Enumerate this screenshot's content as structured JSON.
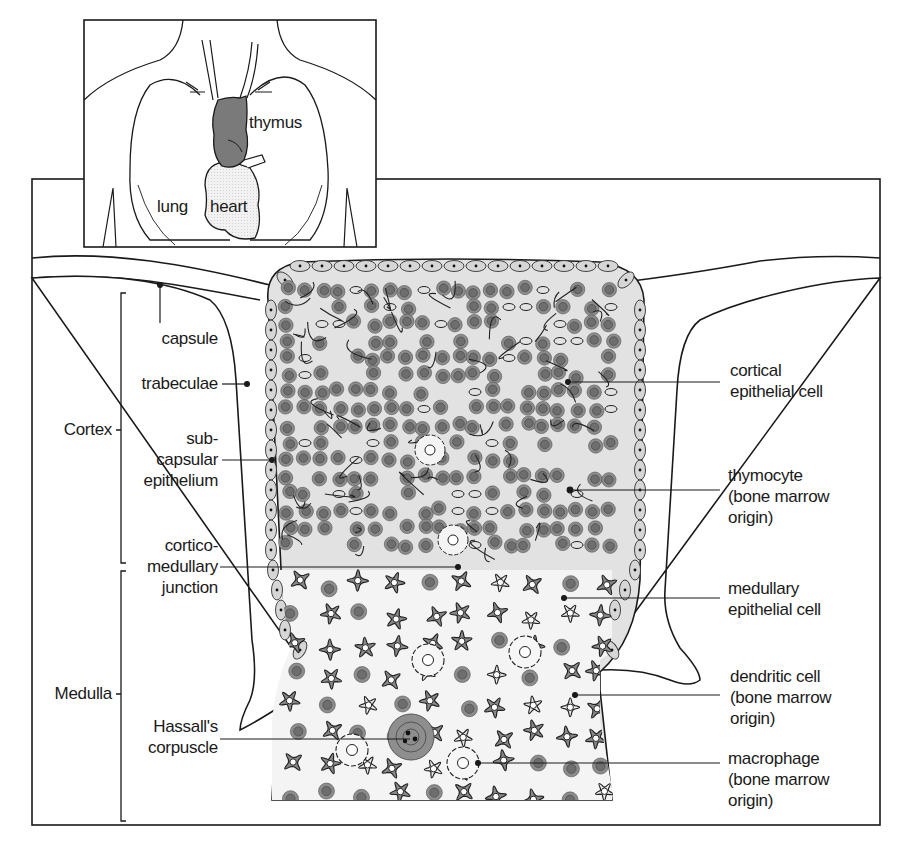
{
  "inset": {
    "labels": {
      "thymus": "thymus",
      "lung": "lung",
      "heart": "heart"
    }
  },
  "labels": {
    "left": {
      "cortex": "Cortex",
      "medulla": "Medulla",
      "capsule": "capsule",
      "trabeculae": "trabeculae",
      "subcapsular_epithelium": "sub-\ncapsular\nepithelium",
      "corticomedullary_junction": "cortico-\nmedullary\njunction",
      "hassalls_corpuscle": "Hassall's\ncorpuscle"
    },
    "right": {
      "cortical_epithelial_cell": "cortical\nepithelial cell",
      "thymocyte": "thymocyte\n(bone marrow\norigin)",
      "medullary_epithelial_cell": "medullary\nepithelial cell",
      "dendritic_cell": "dendritic cell\n(bone marrow\norigin)",
      "macrophage": "macrophage\n(bone marrow\norigin)"
    }
  },
  "colors": {
    "line": "#1a1a1a",
    "thymus_fill": "#7a7a7a",
    "thymocyte_outer": "#8c8c8c",
    "thymocyte_inner": "#6e6e6e",
    "epithelial_fill": "#d6d6d6",
    "cortex_bg": "#e6e6e6",
    "medulla_bg": "#f4f4f4",
    "dendritic_fill": "#8a8a8a",
    "heart_fill": "#efefef"
  }
}
